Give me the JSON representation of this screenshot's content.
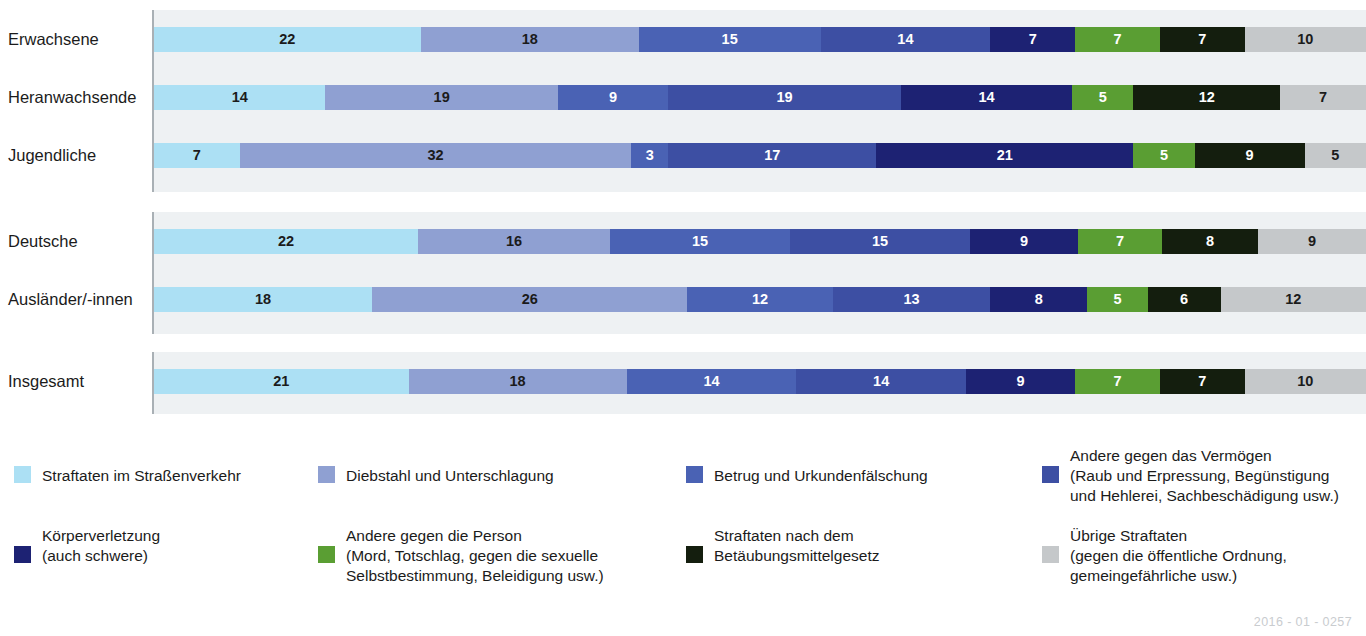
{
  "chart_data": {
    "type": "bar",
    "subtype": "stacked-horizontal-100pct",
    "title": "",
    "xlabel": "",
    "ylabel": "",
    "xlim": [
      0,
      100
    ],
    "grid": false,
    "legend_position": "bottom",
    "categories": [
      "Erwachsene",
      "Heranwachsende",
      "Jugendliche",
      "Deutsche",
      "Ausländer/-innen",
      "Insgesamt"
    ],
    "series": [
      {
        "name": "Straftaten im Straßenverkehr",
        "color": "#ace0f4",
        "label_color": "#1b1b1b",
        "values": [
          22,
          14,
          7,
          22,
          18,
          21
        ]
      },
      {
        "name": "Diebstahl und Unterschlagung",
        "color": "#8fa0d2",
        "label_color": "#1b1b1b",
        "values": [
          18,
          19,
          32,
          16,
          26,
          18
        ]
      },
      {
        "name": "Betrug und Urkundenfälschung",
        "color": "#4a62b4",
        "label_color": "#ffffff",
        "values": [
          15,
          9,
          3,
          15,
          12,
          14
        ]
      },
      {
        "name": "Andere gegen das Vermögen",
        "color": "#3d4fa3",
        "label_color": "#ffffff",
        "values": [
          14,
          19,
          17,
          15,
          13,
          14
        ]
      },
      {
        "name": "Körperverletzung",
        "color": "#1d2273",
        "label_color": "#ffffff",
        "values": [
          7,
          14,
          21,
          9,
          8,
          9
        ]
      },
      {
        "name": "Andere gegen die Person",
        "color": "#5a9e33",
        "label_color": "#ffffff",
        "values": [
          7,
          5,
          5,
          7,
          5,
          7
        ]
      },
      {
        "name": "Straftaten nach dem Betäubungsmittelgesetz",
        "color": "#141e0e",
        "label_color": "#ffffff",
        "values": [
          7,
          12,
          9,
          8,
          6,
          7
        ]
      },
      {
        "name": "Übrige Straftaten",
        "color": "#c5c8ca",
        "label_color": "#1b1b1b",
        "values": [
          10,
          7,
          5,
          9,
          12,
          10
        ]
      }
    ]
  },
  "groups": [
    {
      "name": "alters-gruppen",
      "rows": [
        0,
        1,
        2
      ]
    },
    {
      "name": "staatsangehoerigkeit",
      "rows": [
        3,
        4
      ]
    },
    {
      "name": "insgesamt",
      "rows": [
        5
      ]
    }
  ],
  "legend": {
    "items": [
      {
        "key": "strassenverkehr",
        "color": "#ace0f4",
        "title": "Straftaten im Straßenverkehr",
        "detail": "",
        "text": "Straftaten im Straßenverkehr"
      },
      {
        "key": "diebstahl",
        "color": "#8fa0d2",
        "title": "Diebstahl und Unterschlagung",
        "detail": "",
        "text": "Diebstahl und Unterschlagung"
      },
      {
        "key": "betrug",
        "color": "#4a62b4",
        "title": "Betrug und Urkundenfälschung",
        "detail": "",
        "text": "Betrug und Urkundenfälschung"
      },
      {
        "key": "vermoegen",
        "color": "#3d4fa3",
        "title": "Andere gegen das Vermögen",
        "detail": "(Raub und Erpressung, Begünstigung und Hehlerei, Sachbeschädigung usw.)",
        "text": "Andere gegen das Vermögen\n(Raub und Erpressung, Begünstigung\nund Hehlerei, Sachbeschädigung usw.)"
      },
      {
        "key": "koerperverletzung",
        "color": "#1d2273",
        "title": "Körperverletzung",
        "detail": "(auch schwere)",
        "text": "Körperverletzung\n(auch schwere)"
      },
      {
        "key": "person",
        "color": "#5a9e33",
        "title": "Andere gegen die Person",
        "detail": "(Mord, Totschlag, gegen die sexuelle Selbstbestimmung, Beleidigung usw.)",
        "text": "Andere gegen die Person\n(Mord, Totschlag, gegen die sexuelle\nSelbstbestimmung, Beleidigung usw.)"
      },
      {
        "key": "btmg",
        "color": "#141e0e",
        "title": "Straftaten nach dem Betäubungsmittelgesetz",
        "detail": "",
        "text": "Straftaten nach dem\nBetäubungsmittelgesetz"
      },
      {
        "key": "uebrige",
        "color": "#c5c8ca",
        "title": "Übrige Straftaten",
        "detail": "(gegen die öffentliche Ordnung, gemeingefährliche usw.)",
        "text": "Übrige Straftaten\n(gegen die öffentliche Ordnung,\ngemeingefährliche usw.)"
      }
    ]
  },
  "footer": {
    "code": "2016 - 01 - 0257"
  }
}
